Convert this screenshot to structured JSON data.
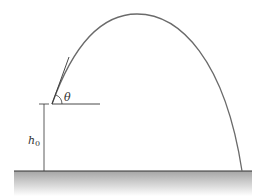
{
  "diagram": {
    "type": "projectile-trajectory",
    "labels": {
      "angle": "θ",
      "height_symbol": "h",
      "height_subscript": "0"
    },
    "colors": {
      "trajectory": "#6a6a6a",
      "lines": "#333333",
      "ground_top": "#9a9a9a",
      "ground_bottom": "#ffffff"
    }
  }
}
